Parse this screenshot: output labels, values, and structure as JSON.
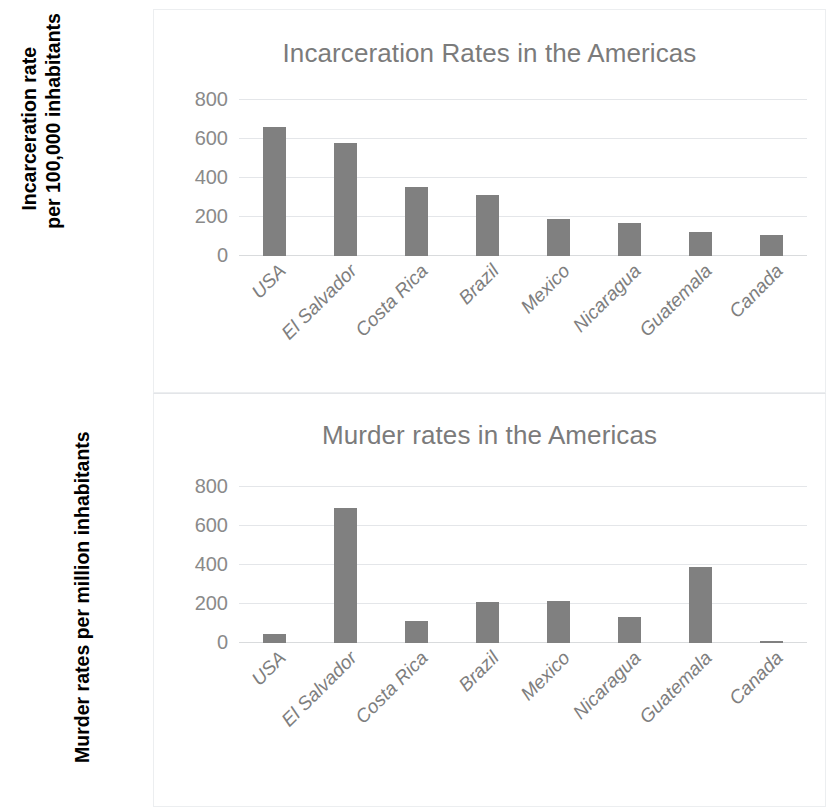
{
  "axis_captions": {
    "incarceration": "Incarceration rate\nper 100,000 inhabitants",
    "murder": "Murder rates per million inhabitants"
  },
  "chart_data": [
    {
      "type": "bar",
      "title": "Incarceration Rates in the Americas",
      "xlabel": "",
      "ylabel": "Incarceration rate per 100,000 inhabitants",
      "categories": [
        "USA",
        "El Salvador",
        "Costa Rica",
        "Brazil",
        "Mexico",
        "Nicaragua",
        "Guatemala",
        "Canada"
      ],
      "values": [
        660,
        580,
        355,
        315,
        190,
        170,
        125,
        110
      ],
      "yticks": [
        "800",
        "600",
        "400",
        "200",
        "0"
      ],
      "ytick_values": [
        800,
        600,
        400,
        200,
        0
      ],
      "ylim": [
        0,
        800
      ],
      "grid": true,
      "legend": false,
      "bar_color": "#808080",
      "title_color": "#7b7b7b"
    },
    {
      "type": "bar",
      "title": "Murder rates in the Americas",
      "xlabel": "",
      "ylabel": "Murder rates per million inhabitants",
      "categories": [
        "USA",
        "El Salvador",
        "Costa Rica",
        "Brazil",
        "Mexico",
        "Nicaragua",
        "Guatemala",
        "Canada"
      ],
      "values": [
        45,
        690,
        115,
        210,
        215,
        135,
        390,
        10
      ],
      "yticks": [
        "800",
        "600",
        "400",
        "200",
        "0"
      ],
      "ytick_values": [
        800,
        600,
        400,
        200,
        0
      ],
      "ylim": [
        0,
        800
      ],
      "grid": true,
      "legend": false,
      "bar_color": "#808080",
      "title_color": "#7b7b7b"
    }
  ]
}
